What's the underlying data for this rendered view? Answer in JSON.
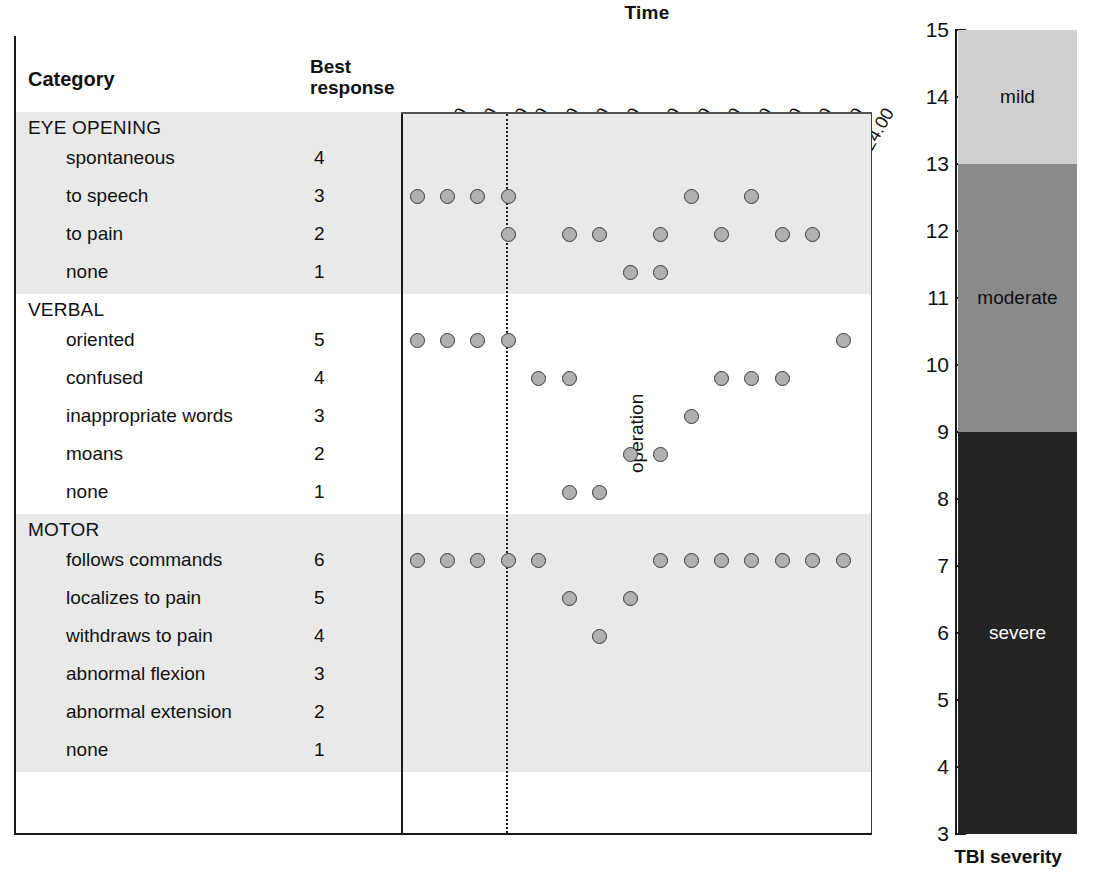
{
  "chart_data": {
    "type": "scatter",
    "title": "Time",
    "xlabel": "Time",
    "ylabel": "Best response",
    "x_tick_labels": [
      "20.00",
      "22.00",
      "24.00",
      "2.00",
      "4.00",
      "6.00",
      "8.00",
      "10.00",
      "12.00",
      "14.00",
      "16.00",
      "18.00",
      "20.00",
      "22.00",
      "24.00"
    ],
    "annotations": [
      {
        "text": "operation",
        "x_between": [
          "24.00",
          "2.00"
        ],
        "orientation": "vertical",
        "line_style": "dotted"
      }
    ],
    "columns": {
      "category": "Category",
      "best_response": "Best response"
    },
    "groups": [
      {
        "name": "EYE OPENING",
        "shaded": true,
        "rows": [
          {
            "label": "spontaneous",
            "score": "4",
            "points": []
          },
          {
            "label": "to speech",
            "score": "3",
            "points": [
              1,
              2,
              3,
              4,
              10,
              12
            ]
          },
          {
            "label": "to pain",
            "score": "2",
            "points": [
              4,
              6,
              7,
              9,
              11,
              13,
              14
            ]
          },
          {
            "label": "none",
            "score": "1",
            "points": [
              8,
              9
            ]
          }
        ]
      },
      {
        "name": "VERBAL",
        "shaded": false,
        "rows": [
          {
            "label": "oriented",
            "score": "5",
            "points": [
              1,
              2,
              3,
              4,
              15
            ]
          },
          {
            "label": "confused",
            "score": "4",
            "points": [
              5,
              6,
              11,
              12,
              13
            ]
          },
          {
            "label": "inappropriate words",
            "score": "3",
            "points": [
              10
            ]
          },
          {
            "label": "moans",
            "score": "2",
            "points": [
              8,
              9
            ]
          },
          {
            "label": "none",
            "score": "1",
            "points": [
              6,
              7
            ]
          }
        ]
      },
      {
        "name": "MOTOR",
        "shaded": true,
        "rows": [
          {
            "label": "follows commands",
            "score": "6",
            "points": [
              1,
              2,
              3,
              4,
              5,
              9,
              10,
              11,
              12,
              13,
              14,
              15
            ]
          },
          {
            "label": "localizes to pain",
            "score": "5",
            "points": [
              6,
              8
            ]
          },
          {
            "label": "withdraws to pain",
            "score": "4",
            "points": [
              7
            ]
          },
          {
            "label": "abnormal flexion",
            "score": "3",
            "points": []
          },
          {
            "label": "abnormal extension",
            "score": "2",
            "points": []
          },
          {
            "label": "none",
            "score": "1",
            "points": []
          }
        ]
      }
    ]
  },
  "severity": {
    "caption": "TBI severity",
    "axis_min": 3,
    "axis_max": 15,
    "tick_labels": [
      "15",
      "14",
      "13",
      "12",
      "11",
      "10",
      "9",
      "8",
      "7",
      "6",
      "5",
      "4",
      "3"
    ],
    "segments": [
      {
        "label": "mild",
        "from": 13,
        "to": 15,
        "color": "#cfcfcf",
        "text_color": "#111111"
      },
      {
        "label": "moderate",
        "from": 9,
        "to": 13,
        "color": "#8a8a8a",
        "text_color": "#111111"
      },
      {
        "label": "severe",
        "from": 3,
        "to": 9,
        "color": "#242424",
        "text_color": "#ffffff"
      }
    ]
  },
  "style": {
    "band_shaded": "#e9e9e9",
    "band_plain": "#ffffff",
    "dot_fill": "#b0b0b0",
    "dot_stroke": "#3a3a3a",
    "axis": "#1a1a1a"
  }
}
